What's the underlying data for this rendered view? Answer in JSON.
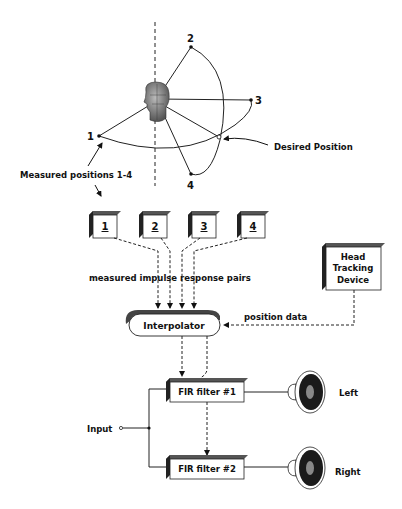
{
  "diagram": {
    "points": [
      {
        "id": "1",
        "label": "1"
      },
      {
        "id": "2",
        "label": "2"
      },
      {
        "id": "3",
        "label": "3"
      },
      {
        "id": "4",
        "label": "4"
      }
    ],
    "desired_position_label": "Desired Position",
    "measured_positions_label": "Measured positions 1-4",
    "boxes": [
      {
        "label": "1"
      },
      {
        "label": "2"
      },
      {
        "label": "3"
      },
      {
        "label": "4"
      }
    ],
    "impulse_label": "measured impulse response pairs",
    "head_tracking": {
      "line1": "Head",
      "line2": "Tracking",
      "line3": "Device"
    },
    "position_data_label": "position data",
    "interpolator_label": "Interpolator",
    "filters": [
      {
        "label": "FIR filter #1"
      },
      {
        "label": "FIR filter #2"
      }
    ],
    "input_label": "Input",
    "speakers": [
      {
        "label": "Left"
      },
      {
        "label": "Right"
      }
    ]
  }
}
